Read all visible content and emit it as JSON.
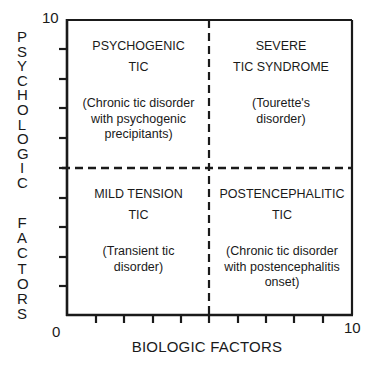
{
  "axes": {
    "y_label": "PSYCHOLOGIC FACTORS",
    "y_label_word1": "PSYCHOLOGIC",
    "y_label_word2": "FACTORS",
    "x_label": "BIOLOGIC FACTORS",
    "y_max_label": "10",
    "origin_label": "0",
    "x_max_label": "10",
    "y_range": [
      0,
      10
    ],
    "x_range": [
      0,
      10
    ]
  },
  "quadrants": {
    "top_left": {
      "title_line1": "PSYCHOGENIC",
      "title_line2": "TIC",
      "desc_line1": "(Chronic tic disorder",
      "desc_line2": "with psychogenic",
      "desc_line3": "precipitants)"
    },
    "top_right": {
      "title_line1": "SEVERE",
      "title_line2": "TIC SYNDROME",
      "desc_line1": "(Tourette's",
      "desc_line2": "disorder)"
    },
    "bottom_left": {
      "title_line1": "MILD TENSION",
      "title_line2": "TIC",
      "desc_line1": "(Transient tic",
      "desc_line2": "disorder)"
    },
    "bottom_right": {
      "title_line1": "POSTENCEPHALITIC",
      "title_line2": "TIC",
      "desc_line1": "(Chronic tic disorder",
      "desc_line2": "with postencephalitis",
      "desc_line3": "onset)"
    }
  },
  "colors": {
    "ink": "#1a1a1a",
    "background": "#ffffff"
  }
}
